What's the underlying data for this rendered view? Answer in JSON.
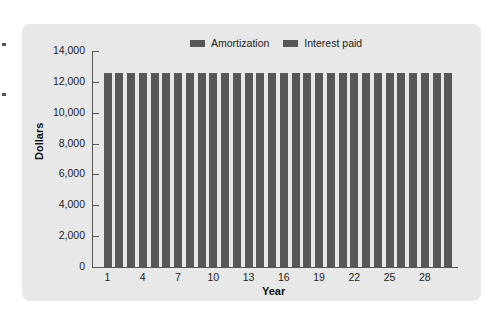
{
  "chart_data": {
    "type": "bar",
    "stacked": true,
    "title": "",
    "xlabel": "Year",
    "ylabel": "Dollars",
    "ylim": [
      0,
      14000
    ],
    "yticks": [
      0,
      2000,
      4000,
      6000,
      8000,
      10000,
      12000,
      14000
    ],
    "ytick_labels": [
      "0",
      "2,000",
      "4,000",
      "6,000",
      "8,000",
      "10,000",
      "12,000",
      "14,000"
    ],
    "xtick_labels": [
      "1",
      "4",
      "7",
      "10",
      "13",
      "16",
      "19",
      "22",
      "25",
      "28"
    ],
    "legend": [
      "Amortization",
      "Interest paid"
    ],
    "legend_position": "top",
    "grid": false,
    "categories": [
      1,
      2,
      3,
      4,
      5,
      6,
      7,
      8,
      9,
      10,
      11,
      12,
      13,
      14,
      15,
      16,
      17,
      18,
      19,
      20,
      21,
      22,
      23,
      24,
      25,
      26,
      27,
      28,
      29,
      30
    ],
    "total_annual_payment": 12600,
    "values": [
      12600,
      12600,
      12600,
      12600,
      12600,
      12600,
      12600,
      12600,
      12600,
      12600,
      12600,
      12600,
      12600,
      12600,
      12600,
      12600,
      12600,
      12600,
      12600,
      12600,
      12600,
      12600,
      12600,
      12600,
      12600,
      12600,
      12600,
      12600,
      12600,
      12600
    ],
    "colors": {
      "Amortization": "#575757",
      "Interest paid": "#575757"
    }
  },
  "legend": {
    "items": [
      {
        "label": "Amortization"
      },
      {
        "label": "Interest paid"
      }
    ]
  },
  "axes": {
    "x_title": "Year",
    "y_title": "Dollars"
  }
}
